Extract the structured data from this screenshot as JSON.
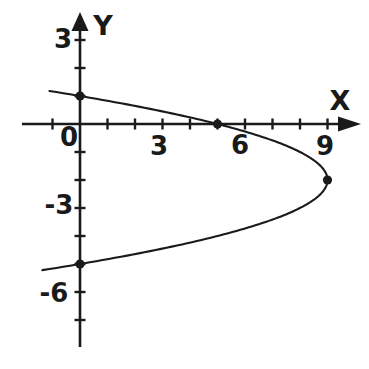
{
  "page": {
    "background": "#ffffff",
    "ink": "#1a1a1a"
  },
  "labels": {
    "y_axis": "Y",
    "x_axis": "X",
    "origin": "0",
    "x_tick_3": "3",
    "x_tick_6": "6",
    "x_tick_9": "9",
    "y_tick_3": "3",
    "y_tick_m3": "-3",
    "y_tick_m6": "-6"
  },
  "chart_data": {
    "type": "line",
    "title": "",
    "equation": {
      "form": "x = h - a*(y - k)^2",
      "h": 9,
      "k": -2,
      "a": 1
    },
    "y_domain": [
      1.18,
      -5.22
    ],
    "marked_points": [
      {
        "x": 0,
        "y": 1
      },
      {
        "x": 5,
        "y": 0
      },
      {
        "x": 9,
        "y": -2
      },
      {
        "x": 0,
        "y": -5
      }
    ],
    "x_intercept": [
      5,
      0
    ],
    "y_intercepts": [
      [
        0,
        1
      ],
      [
        0,
        -5
      ]
    ],
    "vertex": [
      9,
      -2
    ],
    "x_axis": {
      "label": "X",
      "ticks": [
        -1,
        1,
        2,
        3,
        4,
        5,
        6,
        7,
        8,
        9
      ],
      "labeled_ticks": [
        0,
        3,
        6,
        9
      ],
      "range": [
        -2.1,
        10.5
      ]
    },
    "y_axis": {
      "label": "Y",
      "ticks": [
        3,
        2,
        1,
        -1,
        -2,
        -3,
        -4,
        -5,
        -6,
        -7
      ],
      "labeled_ticks": [
        3,
        0,
        -3,
        -6
      ],
      "range": [
        -8,
        4
      ]
    },
    "grid": false,
    "legend": false
  }
}
